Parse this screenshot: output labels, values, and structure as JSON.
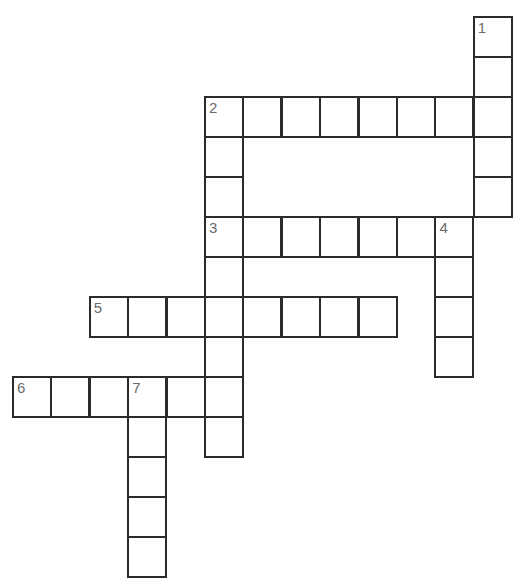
{
  "puzzle": {
    "type": "crossword",
    "origin": {
      "x": 13,
      "y": 17
    },
    "cell_w": 38.4,
    "cell_h": 40,
    "colors": {
      "border": "#2b2b2b",
      "number": "#6b6b6b",
      "background": "#ffffff"
    },
    "entries": [
      {
        "number": "1",
        "direction": "down",
        "row": 0,
        "col": 12,
        "length": 5
      },
      {
        "number": "2",
        "direction": "across",
        "row": 2,
        "col": 5,
        "length": 8
      },
      {
        "number": "2",
        "direction": "down",
        "row": 2,
        "col": 5,
        "length": 3
      },
      {
        "number": "3",
        "direction": "across",
        "row": 5,
        "col": 5,
        "length": 7
      },
      {
        "number": "3",
        "direction": "down",
        "row": 5,
        "col": 5,
        "length": 6
      },
      {
        "number": "4",
        "direction": "down",
        "row": 5,
        "col": 11,
        "length": 4
      },
      {
        "number": "5",
        "direction": "across",
        "row": 7,
        "col": 2,
        "length": 8
      },
      {
        "number": "6",
        "direction": "across",
        "row": 9,
        "col": 0,
        "length": 6
      },
      {
        "number": "7",
        "direction": "down",
        "row": 9,
        "col": 3,
        "length": 5
      }
    ]
  }
}
